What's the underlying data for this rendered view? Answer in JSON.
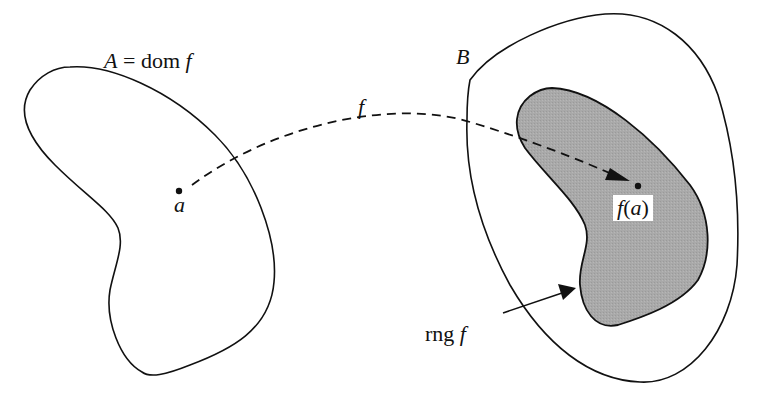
{
  "diagram": {
    "set_a": {
      "name": "A",
      "equals": "=",
      "dom_word": "dom",
      "func": "f"
    },
    "point_a_label": "a",
    "mapping_label": "f",
    "set_b": {
      "name": "B"
    },
    "image_point": {
      "func": "f",
      "open": "(",
      "arg": "a",
      "close": ")"
    },
    "range_label": {
      "rng_word": "rng",
      "func": "f"
    },
    "colors": {
      "stroke": "#111111",
      "range_fill": "#a8a8a8",
      "background": "#ffffff"
    }
  }
}
